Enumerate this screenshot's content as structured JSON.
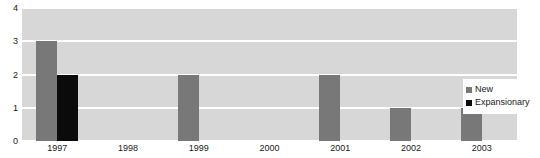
{
  "chart_data": {
    "type": "bar",
    "title": "",
    "xlabel": "",
    "ylabel": "",
    "ylim": [
      0,
      4
    ],
    "yticks": [
      "0",
      "1",
      "2",
      "3",
      "4"
    ],
    "grid": true,
    "legend_position": "right",
    "categories": [
      "1997",
      "1998",
      "1999",
      "2000",
      "2001",
      "2002",
      "2003"
    ],
    "series": [
      {
        "name": "New",
        "color": "#787878",
        "values": [
          3,
          0,
          2,
          0,
          2,
          1,
          1
        ]
      },
      {
        "name": "Expansionary",
        "color": "#0b0b0b",
        "values": [
          2,
          0,
          0,
          0,
          0,
          0,
          0
        ]
      }
    ]
  },
  "legend": {
    "entries": [
      {
        "label": "New",
        "swatch": "new"
      },
      {
        "label": "Expansionary",
        "swatch": "expansionary"
      }
    ]
  },
  "colors": {
    "plot_background": "#d7d7d7",
    "gridline": "#ffffff",
    "page_background": "#ffffff",
    "text": "#1a1a1a",
    "series_new": "#787878",
    "series_expansionary": "#0b0b0b"
  },
  "title_remnant": {
    "text": "··    ··             ·           ·                            ·          ·"
  }
}
